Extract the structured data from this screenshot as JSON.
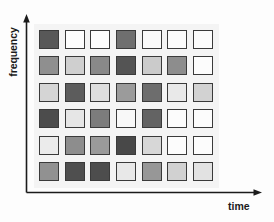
{
  "chart_data": {
    "type": "heatmap",
    "title": "",
    "subtitle": "",
    "xlabel": "time",
    "ylabel": "frequency",
    "grid": false,
    "legend": "none",
    "n_columns": 7,
    "n_rows": 6,
    "x_axis_direction": "increasing-right",
    "y_axis_direction": "increasing-up",
    "value_encoding": "grayscale intensity; darker cell = higher magnitude",
    "colorscale": {
      "min_label": "low",
      "max_label": "high",
      "min_color": "#ffffff",
      "max_color": "#3d3d3d"
    },
    "categories": [
      "t1",
      "t2",
      "t3",
      "t4",
      "t5",
      "t6",
      "t7"
    ],
    "row_labels": [
      "f6",
      "f5",
      "f4",
      "f3",
      "f2",
      "f1"
    ],
    "cells": [
      [
        {
          "value": 0.78,
          "color": "#585858"
        },
        {
          "value": 0.02,
          "color": "#fdfdfd"
        },
        {
          "value": 0.02,
          "color": "#fdfdfd"
        },
        {
          "value": 0.62,
          "color": "#6f6f6f"
        },
        {
          "value": 0.05,
          "color": "#fafafa"
        },
        {
          "value": 0.04,
          "color": "#fbfbfb"
        },
        {
          "value": 0.03,
          "color": "#fcfcfc"
        }
      ],
      [
        {
          "value": 0.55,
          "color": "#8f8f8f"
        },
        {
          "value": 0.28,
          "color": "#cfcfcf"
        },
        {
          "value": 0.58,
          "color": "#898989"
        },
        {
          "value": 0.8,
          "color": "#545454"
        },
        {
          "value": 0.3,
          "color": "#cbcbcb"
        },
        {
          "value": 0.56,
          "color": "#8d8d8d"
        },
        {
          "value": 0.03,
          "color": "#fcfcfc"
        }
      ],
      [
        {
          "value": 0.25,
          "color": "#d5d5d5"
        },
        {
          "value": 0.76,
          "color": "#5c5c5c"
        },
        {
          "value": 0.2,
          "color": "#dedede"
        },
        {
          "value": 0.5,
          "color": "#9b9b9b"
        },
        {
          "value": 0.66,
          "color": "#6d6d6d"
        },
        {
          "value": 0.14,
          "color": "#e9e9e9"
        },
        {
          "value": 0.26,
          "color": "#d2d2d2"
        }
      ],
      [
        {
          "value": 0.84,
          "color": "#4c4c4c"
        },
        {
          "value": 0.16,
          "color": "#e6e6e6"
        },
        {
          "value": 0.62,
          "color": "#7c7c7c"
        },
        {
          "value": 0.06,
          "color": "#f8f8f8"
        },
        {
          "value": 0.72,
          "color": "#636363"
        },
        {
          "value": 0.03,
          "color": "#fcfcfc"
        },
        {
          "value": 0.03,
          "color": "#fcfcfc"
        }
      ],
      [
        {
          "value": 0.13,
          "color": "#ebebeb"
        },
        {
          "value": 0.56,
          "color": "#8d8d8d"
        },
        {
          "value": 0.5,
          "color": "#9a9a9a"
        },
        {
          "value": 0.86,
          "color": "#484848"
        },
        {
          "value": 0.24,
          "color": "#d7d7d7"
        },
        {
          "value": 0.03,
          "color": "#fcfcfc"
        },
        {
          "value": 0.03,
          "color": "#fcfcfc"
        }
      ],
      [
        {
          "value": 0.54,
          "color": "#919191"
        },
        {
          "value": 0.82,
          "color": "#4f4f4f"
        },
        {
          "value": 0.83,
          "color": "#4d4d4d"
        },
        {
          "value": 0.15,
          "color": "#e8e8e8"
        },
        {
          "value": 0.52,
          "color": "#979797"
        },
        {
          "value": 0.27,
          "color": "#d1d1d1"
        },
        {
          "value": 0.18,
          "color": "#e2e2e2"
        }
      ]
    ]
  },
  "axes": {
    "y_label": "frequency",
    "x_label": "time",
    "line_color": "#1b1b1b",
    "arrowheads": true
  },
  "panel": {
    "background_color": "#f4f4f4",
    "cell_border_color": "#3a3a3a"
  }
}
